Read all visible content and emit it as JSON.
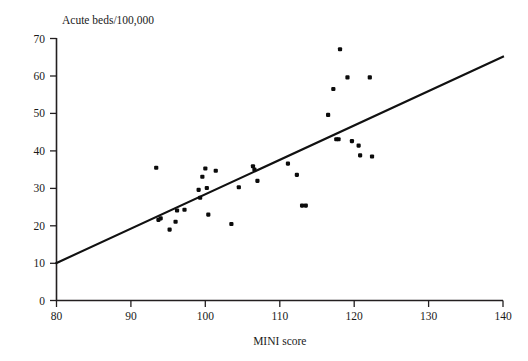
{
  "figure": {
    "title": "Acute beds/100,000",
    "xlabel": "MINI score",
    "ylabel": ""
  },
  "chart_data": {
    "type": "scatter",
    "title": "Acute beds/100,000",
    "xlabel": "MINI score",
    "ylabel": "Acute beds/100,000",
    "xlim": [
      80,
      140
    ],
    "ylim": [
      0,
      70
    ],
    "xticks": [
      80,
      90,
      100,
      110,
      120,
      130,
      140
    ],
    "yticks": [
      0,
      10,
      20,
      30,
      40,
      50,
      60,
      70
    ],
    "xticklabels": [
      "80",
      "90",
      "100",
      "110",
      "120",
      "130",
      "140"
    ],
    "yticklabels": [
      "0",
      "10",
      "20",
      "30",
      "40",
      "50",
      "60",
      "70"
    ],
    "grid": false,
    "legend": null,
    "points": [
      [
        93.4,
        35.4
      ],
      [
        93.7,
        21.5
      ],
      [
        94.0,
        21.9
      ],
      [
        95.2,
        18.9
      ],
      [
        96.0,
        21.0
      ],
      [
        96.2,
        24.0
      ],
      [
        97.2,
        24.2
      ],
      [
        99.1,
        29.5
      ],
      [
        99.3,
        27.4
      ],
      [
        99.6,
        33.0
      ],
      [
        100.0,
        35.2
      ],
      [
        100.2,
        30.0
      ],
      [
        100.4,
        22.9
      ],
      [
        101.4,
        34.6
      ],
      [
        103.5,
        20.4
      ],
      [
        104.5,
        30.2
      ],
      [
        106.4,
        35.8
      ],
      [
        106.6,
        34.9
      ],
      [
        107.0,
        31.9
      ],
      [
        111.1,
        36.5
      ],
      [
        112.3,
        33.5
      ],
      [
        113.0,
        25.3
      ],
      [
        113.5,
        25.3
      ],
      [
        116.5,
        49.5
      ],
      [
        117.2,
        56.4
      ],
      [
        117.6,
        43.0
      ],
      [
        117.9,
        43.0
      ],
      [
        118.1,
        67.0
      ],
      [
        119.1,
        59.5
      ],
      [
        119.7,
        42.5
      ],
      [
        120.6,
        41.3
      ],
      [
        120.8,
        38.7
      ],
      [
        122.1,
        59.5
      ],
      [
        122.4,
        38.4
      ]
    ],
    "fit_line": {
      "type": "linear-regression",
      "x": [
        80,
        140
      ],
      "y": [
        10,
        65
      ]
    }
  }
}
